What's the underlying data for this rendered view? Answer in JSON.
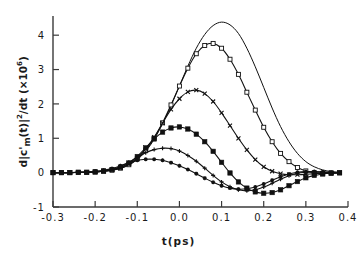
{
  "figure": {
    "width": 357,
    "height": 259,
    "background": "#ffffff",
    "ink_color": "#111111"
  },
  "axes": {
    "x_title": "t(ps)",
    "y_title_html": "d|c'<sub>m</sub>(t)|<sup>2</sup>/dt (&#215;10<sup>6</sup>)",
    "y_title_plain": "d|c'_m(t)|^2/dt (x10^6)",
    "x_ticklabels": [
      "-0.3",
      "-0.2",
      "-0.1",
      "0.0",
      "0.1",
      "0.2",
      "0.3",
      "0.4"
    ],
    "y_ticklabels": [
      "-1",
      "0",
      "1",
      "2",
      "3",
      "4"
    ]
  },
  "chart_data": {
    "type": "line",
    "title": "",
    "xlabel": "t(ps)",
    "ylabel": "d|c'_m(t)|^2/dt (x10^6)",
    "xlim": [
      -0.3,
      0.4
    ],
    "ylim": [
      -1,
      4.5
    ],
    "xticks": [
      -0.3,
      -0.2,
      -0.1,
      0.0,
      0.1,
      0.2,
      0.3,
      0.4
    ],
    "yticks": [
      -1,
      0,
      1,
      2,
      3,
      4
    ],
    "grid": false,
    "legend": "none",
    "x": [
      -0.3,
      -0.28,
      -0.26,
      -0.24,
      -0.22,
      -0.2,
      -0.18,
      -0.16,
      -0.14,
      -0.12,
      -0.1,
      -0.08,
      -0.06,
      -0.04,
      -0.02,
      0.0,
      0.02,
      0.04,
      0.06,
      0.08,
      0.1,
      0.12,
      0.14,
      0.16,
      0.18,
      0.2,
      0.22,
      0.24,
      0.26,
      0.28,
      0.3,
      0.32,
      0.34,
      0.36,
      0.38
    ],
    "series": [
      {
        "name": "curve-1-no-marker",
        "marker": "none",
        "values": [
          0.0,
          0.0,
          0.0,
          0.01,
          0.01,
          0.02,
          0.04,
          0.07,
          0.12,
          0.22,
          0.38,
          0.62,
          0.97,
          1.42,
          1.95,
          2.52,
          3.1,
          3.62,
          4.02,
          4.28,
          4.38,
          4.3,
          4.05,
          3.62,
          3.08,
          2.48,
          1.88,
          1.34,
          0.9,
          0.56,
          0.32,
          0.17,
          0.08,
          0.03,
          0.01
        ]
      },
      {
        "name": "curve-2-open-square",
        "marker": "open-square",
        "values": [
          0.0,
          0.0,
          0.0,
          0.01,
          0.01,
          0.02,
          0.04,
          0.07,
          0.13,
          0.23,
          0.4,
          0.65,
          1.0,
          1.45,
          1.97,
          2.52,
          3.04,
          3.46,
          3.7,
          3.76,
          3.62,
          3.3,
          2.86,
          2.34,
          1.82,
          1.32,
          0.9,
          0.56,
          0.32,
          0.15,
          0.05,
          0.0,
          -0.02,
          -0.02,
          -0.01
        ]
      },
      {
        "name": "curve-3-cross",
        "marker": "cross",
        "values": [
          0.0,
          0.0,
          0.0,
          0.01,
          0.01,
          0.02,
          0.04,
          0.08,
          0.14,
          0.25,
          0.43,
          0.69,
          1.03,
          1.44,
          1.84,
          2.15,
          2.35,
          2.4,
          2.3,
          2.07,
          1.74,
          1.37,
          1.0,
          0.66,
          0.38,
          0.17,
          0.04,
          -0.03,
          -0.06,
          -0.06,
          -0.05,
          -0.03,
          -0.02,
          -0.01,
          0.0
        ]
      },
      {
        "name": "curve-4-filled-square",
        "marker": "filled-square",
        "values": [
          0.0,
          0.0,
          0.0,
          0.01,
          0.01,
          0.02,
          0.05,
          0.09,
          0.16,
          0.28,
          0.47,
          0.72,
          0.98,
          1.18,
          1.3,
          1.33,
          1.27,
          1.12,
          0.9,
          0.62,
          0.3,
          -0.01,
          -0.27,
          -0.45,
          -0.56,
          -0.6,
          -0.58,
          -0.5,
          -0.38,
          -0.26,
          -0.15,
          -0.08,
          -0.04,
          -0.01,
          0.0
        ]
      },
      {
        "name": "curve-5-plus",
        "marker": "plus",
        "values": [
          0.0,
          0.0,
          0.0,
          0.01,
          0.01,
          0.03,
          0.05,
          0.1,
          0.18,
          0.3,
          0.45,
          0.58,
          0.67,
          0.71,
          0.7,
          0.63,
          0.5,
          0.33,
          0.13,
          -0.08,
          -0.27,
          -0.41,
          -0.5,
          -0.53,
          -0.5,
          -0.42,
          -0.31,
          -0.19,
          -0.09,
          -0.02,
          0.01,
          0.02,
          0.01,
          0.0,
          0.0
        ]
      },
      {
        "name": "curve-6-asterisk",
        "marker": "asterisk",
        "values": [
          0.0,
          0.0,
          0.0,
          0.01,
          0.02,
          0.04,
          0.07,
          0.12,
          0.2,
          0.29,
          0.36,
          0.39,
          0.39,
          0.36,
          0.29,
          0.2,
          0.09,
          -0.03,
          -0.16,
          -0.28,
          -0.38,
          -0.45,
          -0.48,
          -0.47,
          -0.42,
          -0.33,
          -0.22,
          -0.12,
          -0.04,
          0.01,
          0.03,
          0.03,
          0.02,
          0.01,
          0.0
        ]
      }
    ]
  }
}
